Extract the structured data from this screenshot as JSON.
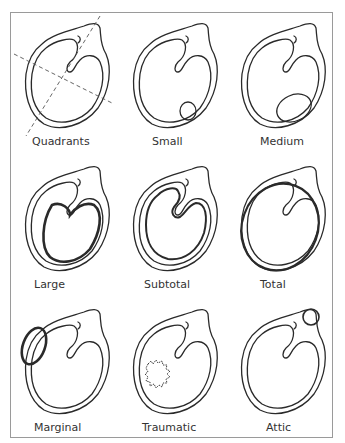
{
  "figure": {
    "panels": [
      {
        "id": "quadrants",
        "label": "Quadrants"
      },
      {
        "id": "small",
        "label": "Small"
      },
      {
        "id": "medium",
        "label": "Medium"
      },
      {
        "id": "large",
        "label": "Large"
      },
      {
        "id": "subtotal",
        "label": "Subtotal"
      },
      {
        "id": "total",
        "label": "Total"
      },
      {
        "id": "marginal",
        "label": "Marginal"
      },
      {
        "id": "traumatic",
        "label": "Traumatic"
      },
      {
        "id": "attic",
        "label": "Attic"
      }
    ]
  },
  "colors": {
    "line": "#2a2a2a",
    "frame": "#9a9a9a",
    "text": "#333333",
    "background": "#ffffff"
  }
}
